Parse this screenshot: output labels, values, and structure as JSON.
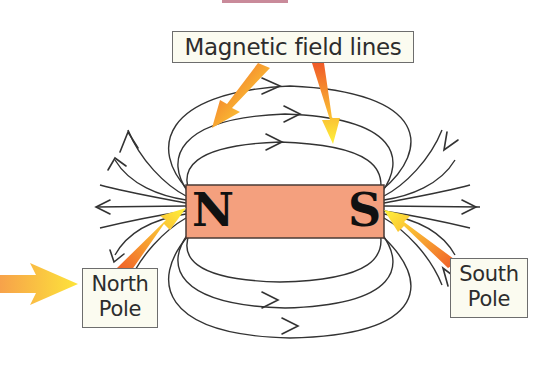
{
  "labels": {
    "field_lines": "Magnetic field lines",
    "north_line1": "North",
    "north_line2": "Pole",
    "south_line1": "South",
    "south_line2": "Pole"
  },
  "magnet": {
    "north_letter": "N",
    "south_letter": "S",
    "fill_color": "#f4a07e",
    "border_color": "#4a3a35"
  },
  "arrows": {
    "gradient_start": "#f26a2e",
    "gradient_end": "#fff23a"
  },
  "colors": {
    "field_line": "#333333",
    "label_bg": "#fbfbf0",
    "label_border": "#6d6d6d"
  }
}
